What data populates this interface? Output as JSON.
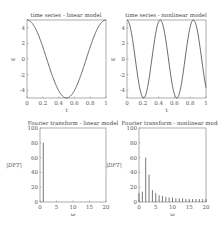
{
  "chart_data": [
    {
      "type": "line",
      "title": "time series - linear model",
      "xlabel": "t",
      "ylabel": "w",
      "xlim": [
        0,
        1
      ],
      "ylim": [
        -5,
        5
      ],
      "xticks": [
        "0",
        "0.2",
        "0.4",
        "0.6",
        "0.8",
        "1"
      ],
      "yticks": [
        "-4",
        "-2",
        "0",
        "2",
        "4"
      ],
      "series": [
        {
          "name": "w(t)",
          "function": "5*cos(2*pi*t)",
          "x": [
            0,
            0.25,
            0.5,
            0.75,
            1
          ],
          "values": [
            5,
            0,
            -5,
            0,
            5
          ]
        }
      ],
      "grid": false
    },
    {
      "type": "line",
      "title": "time series - nonlinear model",
      "xlabel": "t",
      "ylabel": "w",
      "xlim": [
        0,
        1
      ],
      "ylim": [
        -5,
        5
      ],
      "xticks": [
        "0",
        "0.2",
        "0.4",
        "0.6",
        "0.8",
        "1"
      ],
      "yticks": [
        "-4",
        "-2",
        "0",
        "2",
        "4"
      ],
      "series": [
        {
          "name": "w(t)",
          "x": [
            0,
            0.21,
            0.42,
            0.63,
            0.84,
            1.0
          ],
          "values": [
            5,
            -5,
            5,
            -5,
            5,
            -2.5
          ]
        }
      ],
      "grid": false
    },
    {
      "type": "bar",
      "title": "Fourier transform - linear model",
      "xlabel": "ω",
      "ylabel": "|DFT|",
      "xlim": [
        0,
        20
      ],
      "ylim": [
        0,
        100
      ],
      "xticks": [
        "0",
        "5",
        "10",
        "15",
        "20"
      ],
      "yticks": [
        "0",
        "20",
        "40",
        "60",
        "80",
        "100"
      ],
      "categories": [
        1
      ],
      "values": [
        80
      ],
      "grid": false
    },
    {
      "type": "bar",
      "title": "Fourier transform - nonlinear model",
      "xlabel": "ω",
      "ylabel": "|DFT|",
      "xlim": [
        0,
        20
      ],
      "ylim": [
        0,
        100
      ],
      "xticks": [
        "0",
        "5",
        "10",
        "15",
        "20"
      ],
      "yticks": [
        "0",
        "20",
        "40",
        "60",
        "80",
        "100"
      ],
      "categories": [
        0,
        1,
        2,
        3,
        4,
        5,
        6,
        7,
        8,
        9,
        10,
        11,
        12,
        13,
        14,
        15,
        16,
        17,
        18,
        19,
        20
      ],
      "values": [
        12,
        14,
        60,
        37,
        16,
        12,
        9,
        8,
        7,
        6,
        6,
        5,
        5,
        5,
        4,
        4,
        4,
        4,
        4,
        4,
        4
      ],
      "grid": false
    }
  ]
}
